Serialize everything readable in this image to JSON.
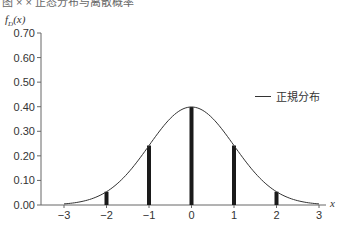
{
  "header": {
    "title_partial": "图 × × 正态分布与离散概率"
  },
  "chart_data": {
    "type": "line",
    "title": "",
    "xlabel": "x",
    "ylabel": "f_D(x)",
    "ylim": [
      0,
      0.7
    ],
    "xlim": [
      -3,
      3
    ],
    "grid": false,
    "legend_position": "right",
    "x_ticks": [
      "−3",
      "−2",
      "−1",
      "0",
      "1",
      "2",
      "3"
    ],
    "y_ticks": [
      "0.70",
      "0.60",
      "0.50",
      "0.40",
      "0.30",
      "0.20",
      "0.10",
      "0.00"
    ],
    "series": [
      {
        "name": "正規分布",
        "kind": "line",
        "x": [
          -3,
          -2.5,
          -2,
          -1.5,
          -1,
          -0.5,
          0,
          0.5,
          1,
          1.5,
          2,
          2.5,
          3
        ],
        "values": [
          0.004,
          0.018,
          0.054,
          0.13,
          0.242,
          0.352,
          0.399,
          0.352,
          0.242,
          0.13,
          0.054,
          0.018,
          0.004
        ]
      },
      {
        "name": "discrete bars",
        "kind": "bar",
        "x": [
          -2,
          -1,
          0,
          1,
          2
        ],
        "values": [
          0.054,
          0.242,
          0.399,
          0.242,
          0.054
        ]
      }
    ]
  },
  "legend": {
    "label": "正規分布"
  },
  "axis": {
    "ylabel_main": "f",
    "ylabel_sub": "D",
    "ylabel_arg": "(x)",
    "xlabel": "x"
  }
}
